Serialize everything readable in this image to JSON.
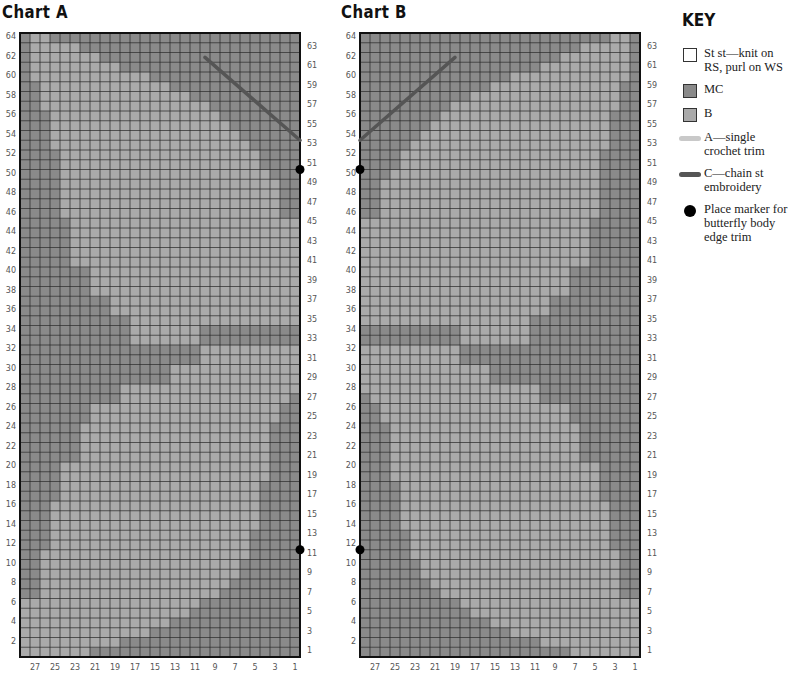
{
  "colors": {
    "mc": "#8a8a8a",
    "b": "#aaaaaa",
    "trim_a": "#c9c9c9",
    "chain_c": "#555555",
    "grid_line": "#222222",
    "marker": "#000000"
  },
  "charts": [
    {
      "id": "A",
      "title": "Chart A",
      "rows": 64,
      "cols": 28,
      "left_row_labels": [
        "64",
        "62",
        "60",
        "58",
        "56",
        "54",
        "52",
        "50",
        "48",
        "46",
        "44",
        "42",
        "40",
        "38",
        "36",
        "34",
        "32",
        "30",
        "28",
        "26",
        "24",
        "22",
        "20",
        "18",
        "16",
        "14",
        "12",
        "10",
        "8",
        "6",
        "4",
        "2"
      ],
      "right_row_labels": [
        "63",
        "61",
        "59",
        "57",
        "55",
        "53",
        "51",
        "49",
        "47",
        "45",
        "43",
        "41",
        "39",
        "37",
        "35",
        "33",
        "31",
        "29",
        "27",
        "25",
        "23",
        "21",
        "19",
        "17",
        "15",
        "13",
        "11",
        "9",
        "7",
        "5",
        "3",
        "1"
      ],
      "col_labels": [
        "27",
        "25",
        "23",
        "21",
        "19",
        "17",
        "15",
        "13",
        "11",
        "9",
        "7",
        "5",
        "3",
        "1"
      ],
      "markers_rows": [
        50,
        11
      ],
      "marker_side": "right",
      "chain_line": {
        "from": [
          9.5,
          61.5
        ],
        "to": [
          0,
          53
        ]
      }
    },
    {
      "id": "B",
      "title": "Chart B",
      "rows": 64,
      "cols": 28,
      "left_row_labels": [
        "64",
        "62",
        "60",
        "58",
        "56",
        "54",
        "52",
        "50",
        "48",
        "46",
        "44",
        "42",
        "40",
        "38",
        "36",
        "34",
        "32",
        "30",
        "28",
        "26",
        "24",
        "22",
        "20",
        "18",
        "16",
        "14",
        "12",
        "10",
        "8",
        "6",
        "4",
        "2"
      ],
      "right_row_labels": [
        "63",
        "61",
        "59",
        "57",
        "55",
        "53",
        "51",
        "49",
        "47",
        "45",
        "43",
        "41",
        "39",
        "37",
        "35",
        "33",
        "31",
        "29",
        "27",
        "25",
        "23",
        "21",
        "19",
        "17",
        "15",
        "13",
        "11",
        "9",
        "7",
        "5",
        "3",
        "1"
      ],
      "col_labels": [
        "27",
        "25",
        "23",
        "21",
        "19",
        "17",
        "15",
        "13",
        "11",
        "9",
        "7",
        "5",
        "3",
        "1"
      ],
      "markers_rows": [
        50,
        11
      ],
      "marker_side": "left",
      "chain_line": {
        "from": [
          18.5,
          61.5
        ],
        "to": [
          28,
          53
        ]
      }
    }
  ],
  "key": {
    "title": "KEY",
    "items": [
      {
        "symbol": "white-square",
        "label": "St st—knit on RS, purl on WS"
      },
      {
        "symbol": "mc-square",
        "label": "MC"
      },
      {
        "symbol": "b-square",
        "label": "B"
      },
      {
        "symbol": "light-line",
        "label": "A—single crochet trim"
      },
      {
        "symbol": "dark-line",
        "label": "C—chain st embroidery"
      },
      {
        "symbol": "black-dot",
        "label": "Place marker for butterfly body edge trim"
      }
    ]
  }
}
